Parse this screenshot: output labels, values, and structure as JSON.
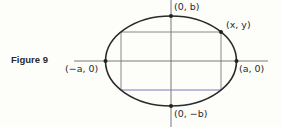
{
  "figure": {
    "caption": "Figure 9",
    "labels": {
      "left_vertex": "(−a, 0)",
      "right_vertex": "(a, 0)",
      "top_vertex": "(0, b)",
      "bottom_vertex": "(0, −b)",
      "point": "(x, y)"
    },
    "colors": {
      "ellipse": "#2a2a2a",
      "axes": "#6a6a6a",
      "rectangle": "#7a7a7a",
      "rectangle_bottom": "#7d7ab8",
      "background": "#fdfdfa"
    }
  }
}
